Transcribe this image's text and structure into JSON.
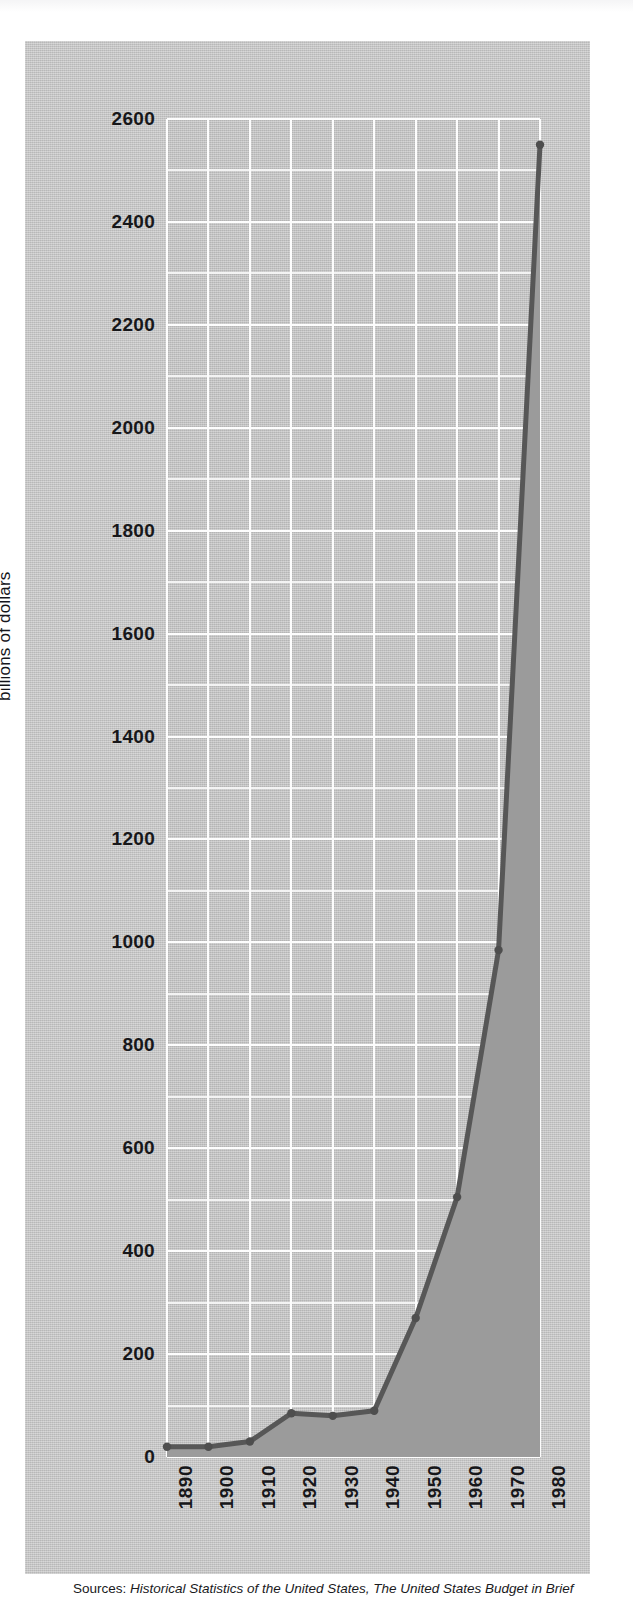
{
  "figure": {
    "ylabel": "billions of dollars",
    "source_lead": "Sources:",
    "source_titles": "Historical Statistics of the United States, The United States Budget in Brief",
    "colors": {
      "plate_background": "#c6c6c6",
      "plot_fill": "#9b9b9b",
      "series_line": "#575757",
      "gridline": "#fdfdfd",
      "text": "#17171a"
    }
  },
  "chart_data": {
    "type": "area",
    "title": "",
    "subtitle": "",
    "xlabel": "",
    "ylabel": "billions of dollars",
    "categories": [
      "1890",
      "1900",
      "1910",
      "1920",
      "1930",
      "1940",
      "1950",
      "1960",
      "1970",
      "1980"
    ],
    "x": [
      1890,
      1900,
      1910,
      1920,
      1930,
      1940,
      1950,
      1960,
      1970,
      1980
    ],
    "values": [
      20,
      20,
      30,
      85,
      80,
      90,
      270,
      505,
      985,
      2550
    ],
    "series": [
      {
        "name": "gross federal debt",
        "values": [
          20,
          20,
          30,
          85,
          80,
          90,
          270,
          505,
          985,
          2550
        ]
      }
    ],
    "xlim": [
      1890,
      1980
    ],
    "ylim": [
      0,
      2600
    ],
    "ytick_labels": [
      "0",
      "200",
      "400",
      "600",
      "800",
      "1000",
      "1200",
      "1400",
      "1600",
      "1800",
      "2000",
      "2200",
      "2400",
      "2600"
    ],
    "ytick_values": [
      0,
      200,
      400,
      600,
      800,
      1000,
      1200,
      1400,
      1600,
      1800,
      2000,
      2200,
      2400,
      2600
    ],
    "minor_ytick_step": 100,
    "grid": true,
    "grid_orientation": "both",
    "legend": "none",
    "markers": true,
    "annotations": []
  }
}
